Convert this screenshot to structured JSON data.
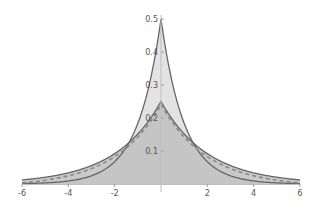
{
  "chart_data": {
    "type": "area",
    "title": "",
    "xlabel": "",
    "ylabel": "",
    "xlim": [
      -6,
      6
    ],
    "ylim": [
      0,
      0.5
    ],
    "grid": false,
    "legend": null,
    "x_ticks": [
      -6,
      -4,
      -2,
      2,
      4,
      6
    ],
    "x_tick_labels": [
      "-6",
      "-4",
      "-2",
      "2",
      "4",
      "6"
    ],
    "y_ticks": [
      0.1,
      0.2,
      0.3,
      0.4,
      0.5
    ],
    "y_tick_labels": [
      "0.1",
      "0.2",
      "0.3",
      "0.4",
      "0.5"
    ],
    "series": [
      {
        "name": "Laplace(0, 1)",
        "description": "Laplace density with scale b=1, peak 0.5 at x=0",
        "scale": 1,
        "peak": 0.5,
        "x": [
          -6,
          -5,
          -4,
          -3,
          -2,
          -1.5,
          -1,
          -0.5,
          0,
          0.5,
          1,
          1.5,
          2,
          3,
          4,
          5,
          6
        ],
        "values": [
          0.0012,
          0.0034,
          0.0092,
          0.0249,
          0.0677,
          0.1116,
          0.1839,
          0.3033,
          0.5,
          0.3033,
          0.1839,
          0.1116,
          0.0677,
          0.0249,
          0.0092,
          0.0034,
          0.0012
        ],
        "color": "#666666",
        "fill": "#d9d9d9"
      },
      {
        "name": "Laplace(0, 2)",
        "description": "Laplace density with scale b=2, peak 0.25 at x=0",
        "scale": 2,
        "peak": 0.25,
        "x": [
          -6,
          -5,
          -4,
          -3,
          -2,
          -1.5,
          -1,
          -0.5,
          0,
          0.5,
          1,
          1.5,
          2,
          3,
          4,
          5,
          6
        ],
        "values": [
          0.0124,
          0.0205,
          0.0338,
          0.0558,
          0.092,
          0.1181,
          0.1516,
          0.1947,
          0.25,
          0.1947,
          0.1516,
          0.1181,
          0.092,
          0.0558,
          0.0338,
          0.0205,
          0.0124
        ],
        "color": "#666666",
        "fill": "#bfbfbf",
        "tail_style": "dashed"
      }
    ]
  }
}
